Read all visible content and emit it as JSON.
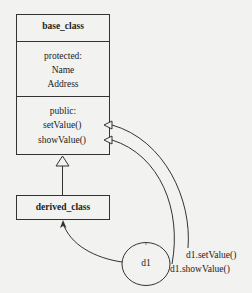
{
  "diagram": {
    "base_class": {
      "name": "base_class",
      "protected_label": "protected:",
      "protected_members": [
        "Name",
        "Address"
      ],
      "public_label": "public:",
      "public_methods": [
        "setValue()",
        "showValue()"
      ]
    },
    "derived_class": {
      "name": "derived_class"
    },
    "object": {
      "name": "d1"
    },
    "calls": [
      {
        "label": "d1.setValue()",
        "target": "setValue()"
      },
      {
        "label": "d1.showValue()",
        "target": "showValue()"
      }
    ],
    "relations": [
      {
        "type": "inheritance",
        "from": "derived_class",
        "to": "base_class"
      },
      {
        "type": "instance-of",
        "from": "d1",
        "to": "derived_class"
      }
    ],
    "colors": {
      "line": "#333333",
      "background": "#f2f2f0"
    }
  }
}
